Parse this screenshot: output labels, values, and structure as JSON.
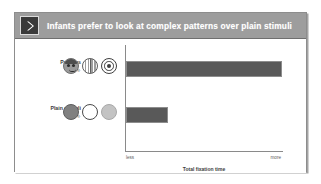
{
  "slide": {
    "header": {
      "icon": "chevron-right-icon",
      "title": "Infants prefer to look at complex patterns over plain stimuli",
      "band_color": "#9d9d9d",
      "icon_bg_color": "#3a3a3a",
      "title_color": "#ffffff"
    },
    "background_color": "#ffffff",
    "border_color": "#8d8d8d"
  },
  "chart_data": {
    "type": "bar",
    "orientation": "horizontal",
    "title": "Infants prefer to look at complex patterns over plain stimuli",
    "categories": [
      "Patterns",
      "Plain stimuli"
    ],
    "values": [
      100,
      27
    ],
    "xlabel": "Total fixation time",
    "ylabel": "",
    "xlim": [
      0,
      100
    ],
    "x_tick_labels": [
      "less",
      "more"
    ],
    "grid": false,
    "legend": "none",
    "bar_color": "#595959",
    "axis_color": "#8a8a8a"
  },
  "rows": [
    {
      "label": "Patterns",
      "sublabel": "e.g.",
      "stimuli": [
        {
          "name": "face-stimulus-icon",
          "kind": "face"
        },
        {
          "name": "striped-circle-stimulus-icon",
          "kind": "stripe"
        },
        {
          "name": "bullseye-stimulus-icon",
          "kind": "bullseye"
        }
      ]
    },
    {
      "label": "Plain stimuli",
      "sublabel": "e.g.",
      "stimuli": [
        {
          "name": "plain-dark-circle-stimulus-icon",
          "kind": "plain-dark"
        },
        {
          "name": "plain-white-circle-stimulus-icon",
          "kind": "plain-white"
        },
        {
          "name": "plain-light-circle-stimulus-icon",
          "kind": "plain-light"
        }
      ]
    }
  ]
}
